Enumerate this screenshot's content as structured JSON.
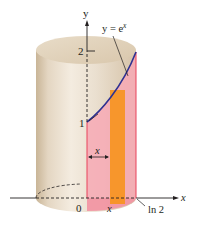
{
  "figure": {
    "curve_label": "y = e",
    "curve_label_exp": "x",
    "y_axis_label": "y",
    "x_axis_label": "x",
    "y_tick_2": "2",
    "y_tick_1": "1",
    "x_origin_label": "0",
    "x_var_label": "x",
    "x_end_label": "ln 2",
    "shell_radius_label": "x"
  },
  "colors": {
    "cylinder_body": "#e8dccb",
    "cylinder_shadow": "#cbb79d",
    "pink_region": "#f7a9b5",
    "pink_edge": "#e8435a",
    "orange_strip": "#f7941d",
    "curve": "#2e3192",
    "axis": "#231f20"
  }
}
